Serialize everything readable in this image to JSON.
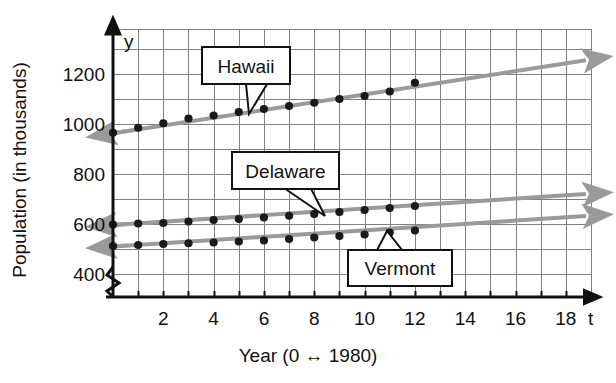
{
  "chart_data": {
    "type": "line",
    "title": "",
    "xlabel": "Year (0 ↔ 1980)",
    "ylabel": "Population  (in thousands)",
    "x_axis_symbol": "t",
    "y_axis_symbol": "y",
    "xlim": [
      0,
      19
    ],
    "ylim": [
      380,
      1300
    ],
    "y_axis_broken": true,
    "grid": true,
    "grid_x_step": 1,
    "grid_y_step": 100,
    "xticks": [
      2,
      4,
      6,
      8,
      10,
      12,
      14,
      16,
      18
    ],
    "xtick_labels": [
      "2",
      "4",
      "6",
      "8",
      "10",
      "12",
      "14",
      "16",
      "18"
    ],
    "yticks": [
      400,
      600,
      800,
      1000,
      1200
    ],
    "ytick_labels": [
      "400",
      "600",
      "800",
      "1000",
      "1200"
    ],
    "legend_position": "callouts-on-plot",
    "x": [
      0,
      1,
      2,
      3,
      4,
      5,
      6,
      7,
      8,
      9,
      10,
      11,
      12
    ],
    "series": [
      {
        "name": "Hawaii",
        "color": "#9a9a9a",
        "marker_color": "#1a1a1a",
        "values": [
          965,
          985,
          1003,
          1022,
          1034,
          1048,
          1060,
          1072,
          1085,
          1100,
          1112,
          1130,
          1165
        ],
        "trend_start": [
          0,
          963
        ],
        "trend_end": [
          18.8,
          1255
        ],
        "arrow_left": true,
        "arrow_right": true
      },
      {
        "name": "Delaware",
        "color": "#9a9a9a",
        "marker_color": "#1a1a1a",
        "values": [
          598,
          602,
          604,
          610,
          616,
          620,
          626,
          633,
          640,
          648,
          656,
          664,
          672
        ],
        "trend_start": [
          0,
          596
        ],
        "trend_end": [
          18.8,
          720
        ],
        "arrow_left": true,
        "arrow_right": true
      },
      {
        "name": "Vermont",
        "color": "#9a9a9a",
        "marker_color": "#1a1a1a",
        "values": [
          512,
          516,
          520,
          523,
          526,
          530,
          534,
          540,
          546,
          552,
          558,
          566,
          574
        ],
        "trend_start": [
          0,
          510
        ],
        "trend_end": [
          18.8,
          632
        ],
        "arrow_left": true,
        "arrow_right": true
      }
    ],
    "callouts": [
      {
        "label": "Hawaii",
        "box": [
          202,
          47,
          88,
          37
        ],
        "tip": [
          249,
          114
        ]
      },
      {
        "label": "Delaware",
        "box": [
          232,
          152,
          107,
          37
        ],
        "tip": [
          325,
          216
        ]
      },
      {
        "label": "Vermont",
        "box": [
          348,
          250,
          104,
          36
        ],
        "tip": [
          387,
          231
        ]
      }
    ]
  }
}
